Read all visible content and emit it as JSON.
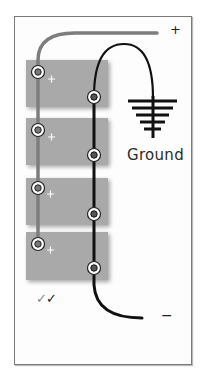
{
  "diagram": {
    "terminal_labels": {
      "positive": "+",
      "negative": "−"
    },
    "ground": {
      "label": "Ground",
      "icon": "ground-icon"
    },
    "batteries": [
      {
        "index": 1,
        "positive_terminal_label": "+"
      },
      {
        "index": 2,
        "positive_terminal_label": "+"
      },
      {
        "index": 3,
        "positive_terminal_label": "+"
      },
      {
        "index": 4,
        "positive_terminal_label": "+"
      }
    ],
    "checkmarks": "✓✓",
    "check_1": "✓",
    "check_2": "✓",
    "colors": {
      "battery": "#a9a9a9",
      "positive_wire": "#7d7d7d",
      "negative_wire": "#111111",
      "frame": "#7a7a7a"
    }
  }
}
